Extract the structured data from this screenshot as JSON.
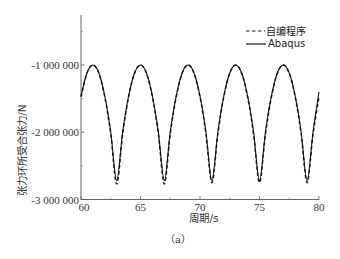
{
  "chart_data": {
    "type": "line",
    "title": "",
    "caption": "（a）",
    "xlabel": "周期/s",
    "ylabel": "张力环所受合张力/N",
    "xlim": [
      60,
      80
    ],
    "ylim": [
      -3000000,
      -260000
    ],
    "xticks": [
      60,
      65,
      70,
      75,
      80
    ],
    "xtick_labels": [
      "60",
      "65",
      "70",
      "75",
      "80"
    ],
    "x_minor_ticks": [
      62.5,
      67.5,
      72.5,
      77.5
    ],
    "yticks": [
      -1000000,
      -2000000,
      -3000000
    ],
    "ytick_labels": [
      "-1 000 000",
      "-2 000 000",
      "-3 000 000"
    ],
    "y_minor_ticks": [
      -500000,
      -1500000,
      -2500000
    ],
    "grid": false,
    "legend_position": "upper right",
    "x": [
      60,
      60.5,
      61,
      61.5,
      62,
      62.5,
      63,
      63.5,
      64,
      64.5,
      65,
      65.5,
      66,
      66.5,
      67,
      67.5,
      68,
      68.5,
      69,
      69.5,
      70,
      70.5,
      71,
      71.5,
      72,
      72.5,
      73,
      73.5,
      74,
      74.5,
      75,
      75.5,
      76,
      76.5,
      77,
      77.5,
      78,
      78.5,
      79,
      79.5,
      80
    ],
    "series": [
      {
        "name": "自编程序",
        "style": "dashed",
        "color": "#222222",
        "values": [
          -1474000,
          -1122000,
          -1000000,
          -1122000,
          -1474000,
          -2025000,
          -2770000,
          -2025000,
          -1474000,
          -1122000,
          -1000000,
          -1122000,
          -1474000,
          -2025000,
          -2770000,
          -2025000,
          -1474000,
          -1122000,
          -1000000,
          -1122000,
          -1474000,
          -2025000,
          -2750000,
          -2025000,
          -1474000,
          -1122000,
          -1000000,
          -1122000,
          -1474000,
          -2025000,
          -2750000,
          -2025000,
          -1474000,
          -1122000,
          -1000000,
          -1122000,
          -1474000,
          -2025000,
          -2750000,
          -2025000,
          -1474000
        ]
      },
      {
        "name": "Abaqus",
        "style": "solid",
        "color": "#111111",
        "values": [
          -1461000,
          -1119000,
          -1000000,
          -1119000,
          -1461000,
          -1996000,
          -2720000,
          -1996000,
          -1461000,
          -1119000,
          -1000000,
          -1119000,
          -1461000,
          -1996000,
          -2720000,
          -1996000,
          -1461000,
          -1119000,
          -1000000,
          -1119000,
          -1461000,
          -1996000,
          -2720000,
          -1996000,
          -1461000,
          -1119000,
          -1000000,
          -1119000,
          -1461000,
          -1996000,
          -2720000,
          -1996000,
          -1461000,
          -1119000,
          -1000000,
          -1119000,
          -1461000,
          -1996000,
          -2720000,
          -1996000,
          -1400000
        ]
      }
    ]
  },
  "legend": {
    "items": [
      {
        "label": "- - -自编程序",
        "text": "自编程序",
        "style": "dashed"
      },
      {
        "label": "Abaqus",
        "text": "Abaqus",
        "style": "solid"
      }
    ]
  }
}
